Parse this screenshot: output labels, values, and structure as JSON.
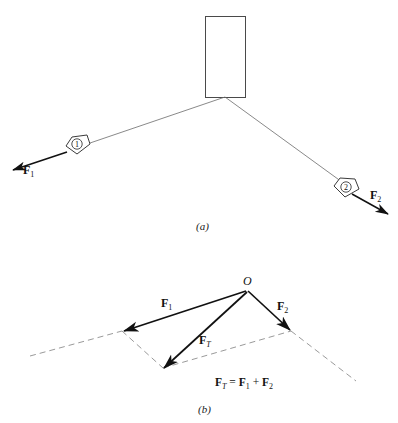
{
  "figure": {
    "panels": [
      {
        "id": "a",
        "caption": "(a)",
        "description": "Plate suspended by two cables with tension forces F1 and F2",
        "body": {
          "name": "rectangular-plate"
        },
        "tags": [
          {
            "id": "tag-1",
            "number": "1"
          },
          {
            "id": "tag-2",
            "number": "2"
          }
        ],
        "force_labels": [
          {
            "symbol": "F",
            "subscript": "1"
          },
          {
            "symbol": "F",
            "subscript": "2"
          }
        ]
      },
      {
        "id": "b",
        "caption": "(b)",
        "description": "Parallelogram law vector addition of F1 and F2 giving resultant FT",
        "origin_label": "O",
        "force_labels": [
          {
            "symbol": "F",
            "subscript": "1"
          },
          {
            "symbol": "F",
            "subscript": "2"
          },
          {
            "symbol": "F",
            "subscript": "T"
          }
        ],
        "equation": {
          "lhs_symbol": "F",
          "lhs_sub": "T",
          "equals": "=",
          "term1_symbol": "F",
          "term1_sub": "1",
          "plus": "+",
          "term2_symbol": "F",
          "term2_sub": "2"
        }
      }
    ]
  },
  "colors": {
    "ink": "#111111",
    "thin_line": "#555555",
    "dashed": "#888888",
    "background": "#ffffff"
  }
}
